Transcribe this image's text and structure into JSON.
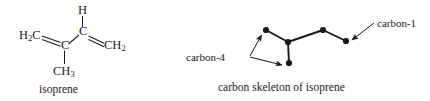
{
  "figure": {
    "background": "#ffffff",
    "ink": "#1a1a1a",
    "width": 430,
    "height": 101
  },
  "structure": {
    "name": "isoprene",
    "caption": "isoprene",
    "atoms": {
      "h_top": "H",
      "h2c_left": "H",
      "h2c_left_sub": "2",
      "h2c_left_c": "C",
      "c_vinyl": "C",
      "c_center": "C",
      "ch3": "CH",
      "ch3_sub": "3",
      "ch2_right": "CH",
      "ch2_right_sub": "2"
    },
    "bond_types": {
      "h_to_c": "single",
      "h2c_to_c": "double",
      "c_to_c": "single",
      "c_to_ch3": "single",
      "c_to_ch2": "double"
    }
  },
  "skeleton": {
    "caption": "carbon skeleton of isoprene",
    "label_carbon_1": "carbon-1",
    "label_carbon_4": "carbon-4",
    "vertex_count": 5,
    "vertices": [
      {
        "id": "c4a",
        "x": 266,
        "y": 30
      },
      {
        "id": "cj",
        "x": 288,
        "y": 42
      },
      {
        "id": "c4b",
        "x": 289,
        "y": 63
      },
      {
        "id": "c2",
        "x": 323,
        "y": 30
      },
      {
        "id": "c1",
        "x": 346,
        "y": 41
      }
    ],
    "edges": [
      [
        "c4a",
        "cj"
      ],
      [
        "cj",
        "c4b"
      ],
      [
        "cj",
        "c2"
      ],
      [
        "c2",
        "c1"
      ]
    ],
    "annotations": [
      {
        "label": "carbon-1",
        "points_to": "c1"
      },
      {
        "label": "carbon-4",
        "points_to": "c4a"
      },
      {
        "label": "carbon-4",
        "points_to": "c4b"
      }
    ]
  }
}
